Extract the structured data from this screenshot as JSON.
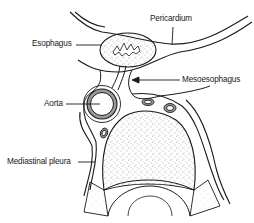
{
  "diagram": {
    "type": "anatomical-cross-section",
    "colors": {
      "line": "#1a1a1a",
      "fill": "#ffffff",
      "stipple": "#555555"
    },
    "labels": {
      "pericardium": "Pericardium",
      "esophagus": "Esophagus",
      "mesoesophagus": "Mesoesophagus",
      "aorta": "Aorta",
      "mediastinal_pleura": "Mediastinal pleura"
    }
  }
}
